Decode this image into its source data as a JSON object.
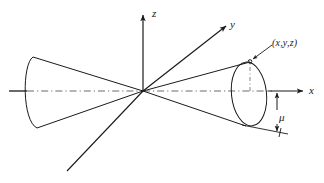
{
  "figure": {
    "background_color": "#ffffff",
    "ink_color": "#1a1a1a",
    "width": 324,
    "height": 183
  },
  "axes": {
    "origin": {
      "x": 143,
      "y": 91
    },
    "z": {
      "label": "z",
      "from": {
        "x": 143,
        "y": 91
      },
      "to": {
        "x": 143,
        "y": 12
      },
      "arrow": true,
      "style": "solid"
    },
    "y": {
      "label": "y",
      "from": {
        "x": 143,
        "y": 91
      },
      "to": {
        "x": 228,
        "y": 24
      },
      "arrow": true,
      "style": "solid"
    },
    "y_negative": {
      "label": "",
      "from": {
        "x": 143,
        "y": 91
      },
      "to": {
        "x": 68,
        "y": 170
      },
      "arrow": false,
      "style": "solid"
    },
    "x": {
      "label": "x",
      "from": {
        "x": 143,
        "y": 91
      },
      "to": {
        "x": 305,
        "y": 91
      },
      "arrow": true,
      "style": "dash-dot-then-solid"
    },
    "x_negative": {
      "label": "",
      "from": {
        "x": 143,
        "y": 91
      },
      "to": {
        "x": 10,
        "y": 91
      },
      "arrow": false,
      "style": "dash-dot-then-solid"
    }
  },
  "cones": {
    "right": {
      "apex": {
        "x": 143,
        "y": 91
      },
      "cap_center": {
        "x": 249,
        "y": 91
      },
      "cap_rx": 17,
      "cap_ry": 31,
      "cap_style": "solid-ellipse",
      "generator_top": {
        "x": 249,
        "y": 63
      },
      "generator_bottom": {
        "x": 249,
        "y": 128
      }
    },
    "left": {
      "apex": {
        "x": 143,
        "y": 91
      },
      "cap_center": {
        "x": 33,
        "y": 91
      },
      "cap_rx": 11,
      "cap_ry": 36,
      "cap_style": "open-arc",
      "generator_top": {
        "x": 33,
        "y": 57
      },
      "generator_bottom": {
        "x": 33,
        "y": 128
      }
    }
  },
  "annotations": {
    "point_label": "(x,y,z)",
    "point_marker": {
      "x": 250,
      "y": 62
    },
    "leader_from": {
      "x": 270,
      "y": 45
    },
    "leader_to": {
      "x": 252,
      "y": 61
    },
    "dashed_radius": {
      "from": {
        "x": 250,
        "y": 62
      },
      "to": {
        "x": 250,
        "y": 91
      },
      "style": "dash-dot"
    },
    "mu_label": "μ",
    "mu_dimension": {
      "from": {
        "x": 277,
        "y": 91
      },
      "to": {
        "x": 277,
        "y": 131
      },
      "double_arrow": true
    },
    "mu_tick_line": {
      "from": {
        "x": 243,
        "y": 126
      },
      "to": {
        "x": 285,
        "y": 133
      }
    }
  },
  "axis_labels": {
    "x": "x",
    "y": "y",
    "z": "z"
  }
}
